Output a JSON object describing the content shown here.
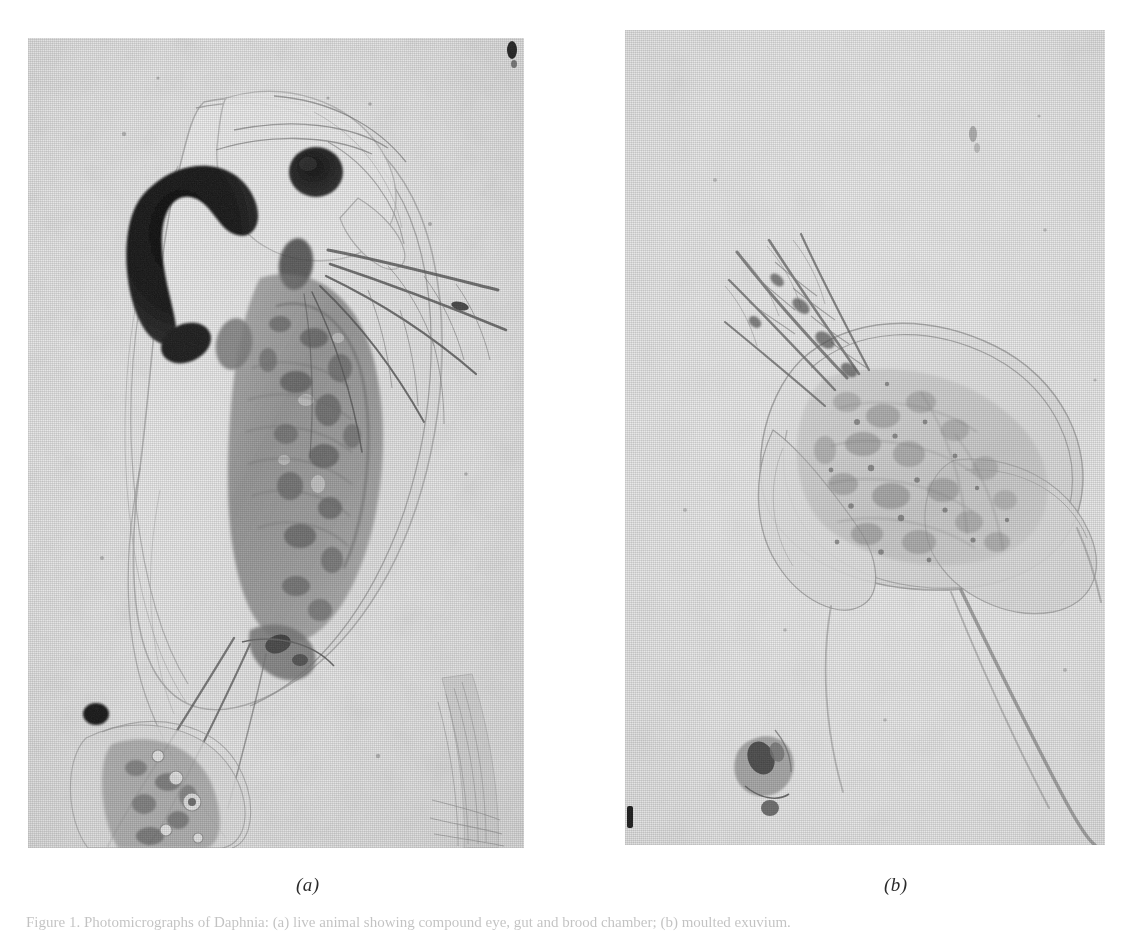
{
  "figure": {
    "panels": [
      {
        "id": "a",
        "letter": "(a)",
        "subject": "Daphnia specimen, lateral view, dark compound eye and pigmented ocellus visible",
        "contrast": "high",
        "background_hex": "#e7e7e7",
        "ink_hex": "#1d1d1d"
      },
      {
        "id": "b",
        "letter": "(b)",
        "subject": "Pale moulted Daphnia carapace with apical tail spine and detached debris fragment",
        "contrast": "low",
        "background_hex": "#ececec",
        "ink_hex": "#6e6e6e"
      }
    ],
    "caption": {
      "label": "Figure 1.",
      "text": "Figure 1. Photomicrographs of Daphnia: (a) live animal showing compound eye, gut and brood chamber; (b) moulted exuvium."
    },
    "page_background_hex": "#ffffff"
  }
}
